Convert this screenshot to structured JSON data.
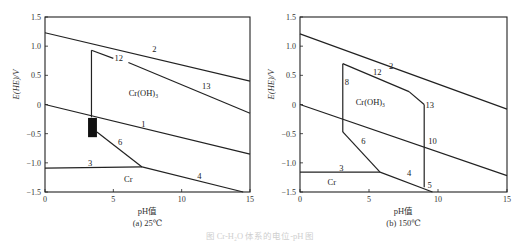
{
  "figure_caption": "图 Cr-H₂O 体系的电位-pH 图",
  "chart_data": [
    {
      "type": "line",
      "panel": "a",
      "caption": "(a) 25℃",
      "xlabel": "pH值",
      "ylabel": "E(HE)/V",
      "xlim": [
        0,
        15
      ],
      "ylim": [
        -1.5,
        1.5
      ],
      "xticks": [
        0,
        5,
        10,
        15
      ],
      "xtick_labels": [
        "0",
        "5",
        "10",
        "15"
      ],
      "yticks": [
        1.5,
        1.0,
        0.5,
        0,
        -0.5,
        -1.0,
        -1.5
      ],
      "ytick_labels": [
        "1.5",
        "1.0",
        "0.5",
        "0",
        "−0.5",
        "−1.0",
        "−1.5"
      ],
      "grid": false,
      "series": [
        {
          "name": "2",
          "points": [
            [
              0,
              1.23
            ],
            [
              15,
              0.4
            ]
          ],
          "label_at": [
            8,
            0.96
          ]
        },
        {
          "name": "1",
          "points": [
            [
              0,
              0.0
            ],
            [
              15,
              -0.85
            ]
          ],
          "label_at": [
            7.2,
            -0.33
          ]
        },
        {
          "name": "boundary-vertical",
          "points": [
            [
              3.4,
              0.93
            ],
            [
              3.4,
              -0.22
            ]
          ]
        },
        {
          "name": "12",
          "points": [
            [
              3.4,
              0.93
            ],
            [
              5.0,
              0.79
            ]
          ],
          "label_at": [
            5.4,
            0.79
          ]
        },
        {
          "name": "13",
          "points": [
            [
              6.1,
              0.72
            ],
            [
              15,
              -0.15
            ]
          ],
          "label_at": [
            11.8,
            0.32
          ]
        },
        {
          "name": "6",
          "points": [
            [
              3.8,
              -0.47
            ],
            [
              7.1,
              -1.07
            ]
          ],
          "label_at": [
            5.5,
            -0.65
          ]
        },
        {
          "name": "3",
          "points": [
            [
              0,
              -1.09
            ],
            [
              7.1,
              -1.07
            ]
          ],
          "label_at": [
            3.3,
            -1.0
          ]
        },
        {
          "name": "4",
          "points": [
            [
              7.1,
              -1.07
            ],
            [
              14.5,
              -1.5
            ]
          ],
          "label_at": [
            11.3,
            -1.22
          ]
        }
      ],
      "regions": [
        {
          "label": "Cr(OH)₃",
          "at": [
            7.2,
            0.2
          ]
        },
        {
          "label": "Cr",
          "at": [
            6.1,
            -1.27
          ]
        }
      ],
      "highlight_box": {
        "x": [
          3.15,
          3.8
        ],
        "y": [
          -0.56,
          -0.23
        ]
      }
    },
    {
      "type": "line",
      "panel": "b",
      "caption": "(b) 150℃",
      "xlabel": "pH值",
      "ylabel": "E(HE)/V",
      "xlim": [
        0,
        15
      ],
      "ylim": [
        -1.5,
        1.5
      ],
      "xticks": [
        0,
        5,
        10,
        15
      ],
      "xtick_labels": [
        "0",
        "5",
        "10",
        "15"
      ],
      "yticks": [
        1.5,
        1.0,
        0.5,
        0,
        -0.5,
        -1.0,
        -1.5
      ],
      "ytick_labels": [
        "1.5",
        "1.0",
        "0.5",
        "0",
        "−0.5",
        "−1.0",
        "−1.5"
      ],
      "grid": false,
      "series": [
        {
          "name": "2",
          "points": [
            [
              0,
              1.21
            ],
            [
              15,
              -0.08
            ]
          ],
          "label_at": [
            6.6,
            0.66
          ]
        },
        {
          "name": "10",
          "points": [
            [
              0,
              0.0
            ],
            [
              15,
              -1.22
            ]
          ],
          "label_at": [
            9.6,
            -0.62
          ]
        },
        {
          "name": "8",
          "points": [
            [
              3.1,
              0.7
            ],
            [
              3.1,
              -0.47
            ]
          ],
          "label_at": [
            3.4,
            0.39
          ]
        },
        {
          "name": "12",
          "points": [
            [
              3.1,
              0.7
            ],
            [
              7.9,
              0.22
            ]
          ],
          "label_at": [
            5.6,
            0.55
          ]
        },
        {
          "name": "13",
          "points": [
            [
              7.9,
              0.22
            ],
            [
              9.0,
              0.0
            ]
          ],
          "label_at": [
            9.4,
            0.0
          ]
        },
        {
          "name": "boundary-vertical",
          "points": [
            [
              9.0,
              0.0
            ],
            [
              9.0,
              -1.42
            ]
          ]
        },
        {
          "name": "6",
          "points": [
            [
              3.1,
              -0.47
            ],
            [
              5.8,
              -1.16
            ]
          ],
          "label_at": [
            4.6,
            -0.63
          ]
        },
        {
          "name": "3",
          "points": [
            [
              0,
              -1.16
            ],
            [
              5.8,
              -1.16
            ]
          ],
          "label_at": [
            3.0,
            -1.09
          ]
        },
        {
          "name": "4",
          "points": [
            [
              5.8,
              -1.16
            ],
            [
              9.6,
              -1.5
            ]
          ],
          "label_at": [
            7.9,
            -1.18
          ]
        },
        {
          "name": "5",
          "points": [],
          "label_at": [
            9.4,
            -1.38
          ]
        }
      ],
      "regions": [
        {
          "label": "Cr(OH)₃",
          "at": [
            5.1,
            0.05
          ]
        },
        {
          "label": "Cr",
          "at": [
            2.3,
            -1.32
          ]
        }
      ]
    }
  ]
}
